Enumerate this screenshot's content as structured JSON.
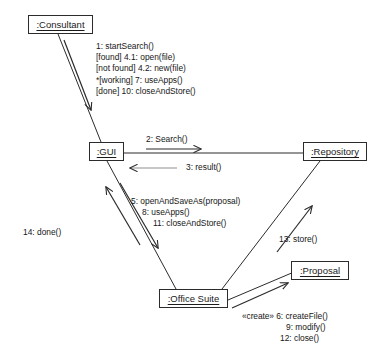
{
  "diagram": {
    "kind": "uml-communication-diagram",
    "title": "",
    "stroke_color": "#2b2b2b",
    "text_color": "#161616",
    "background": "#ffffff",
    "objects": [
      {
        "id": "consultant",
        "label": ":Consultant",
        "x": 28,
        "y": 15,
        "w": 65,
        "h": 19
      },
      {
        "id": "gui",
        "label": ":GUI",
        "x": 89,
        "y": 142,
        "w": 35,
        "h": 19
      },
      {
        "id": "repository",
        "label": ":Repository",
        "x": 303,
        "y": 142,
        "w": 64,
        "h": 19
      },
      {
        "id": "office_suite",
        "label": ":Office Suite",
        "x": 159,
        "y": 289,
        "w": 69,
        "h": 19
      },
      {
        "id": "proposal",
        "label": ":Proposal",
        "x": 291,
        "y": 261,
        "w": 58,
        "h": 19
      }
    ],
    "messages": [
      {
        "id": "consultant-to-gui",
        "from": "consultant",
        "to": "gui",
        "lines": [
          "1: startSearch()",
          "[found] 4.1: open(file)",
          "[not found] 4.2: new(file)",
          "*[working] 7: useApps()",
          "[done] 10: closeAndStore()"
        ]
      },
      {
        "id": "gui-to-repository",
        "from": "gui",
        "to": "repository",
        "lines": [
          "2: Search()"
        ]
      },
      {
        "id": "repository-to-gui",
        "from": "repository",
        "to": "gui",
        "lines": [
          "3: result()"
        ]
      },
      {
        "id": "gui-to-office-suite",
        "from": "gui",
        "to": "office_suite",
        "lines": [
          "5: openAndSaveAs(proposal)",
          "8: useApps()",
          "11: closeAndStore()"
        ]
      },
      {
        "id": "office-suite-to-gui",
        "from": "office_suite",
        "to": "gui",
        "lines": [
          "14: done()"
        ]
      },
      {
        "id": "office-suite-to-repository",
        "from": "office_suite",
        "to": "repository",
        "lines": [
          "13: store()"
        ]
      },
      {
        "id": "office-suite-to-proposal",
        "from": "office_suite",
        "to": "proposal",
        "stereotype": "«create»",
        "lines": [
          "6: createFile()",
          "9: modify()",
          "12: close()"
        ]
      }
    ]
  }
}
